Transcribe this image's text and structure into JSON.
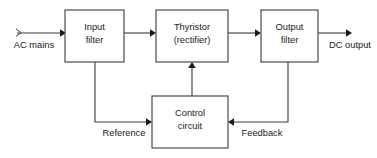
{
  "diagram": {
    "colors": {
      "background": "#ffffff",
      "stroke": "#3a3a3a",
      "text": "#1a1a1a",
      "arrow": "#1a1a1a"
    },
    "blocks": [
      {
        "id": "input-filter",
        "line1": "Input",
        "line2": "filter"
      },
      {
        "id": "thyristor-rectifier",
        "line1": "Thyristor",
        "line2": "(rectifier)"
      },
      {
        "id": "output-filter",
        "line1": "Output",
        "line2": "filter"
      },
      {
        "id": "control-circuit",
        "line1": "Control",
        "line2": "circuit"
      }
    ],
    "signals": {
      "ac_mains": "AC mains",
      "dc_output": "DC output",
      "reference": "Reference",
      "feedback": "Feedback"
    }
  }
}
